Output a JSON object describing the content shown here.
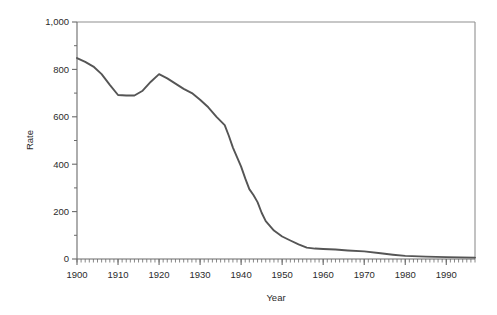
{
  "chart_data": {
    "type": "line",
    "title": "",
    "xlabel": "Year",
    "ylabel": "Rate",
    "xlim": [
      1900,
      1997
    ],
    "ylim": [
      0,
      1000
    ],
    "grid": false,
    "legend": null,
    "x_tick_labels": [
      "1900",
      "1910",
      "1920",
      "1930",
      "1940",
      "1950",
      "1960",
      "1970",
      "1980",
      "1990"
    ],
    "x_major_ticks": [
      1900,
      1910,
      1920,
      1930,
      1940,
      1950,
      1960,
      1970,
      1980,
      1990
    ],
    "x_minor_tick_interval": 1,
    "y_tick_labels": [
      "0",
      "200",
      "400",
      "600",
      "800",
      "1,000"
    ],
    "y_major_ticks": [
      0,
      200,
      400,
      600,
      800,
      1000
    ],
    "y_minor_ticks": [
      100,
      300,
      500,
      700,
      900
    ],
    "line_color": "#555555",
    "axis_color": "#808080",
    "series": [
      {
        "name": "Rate",
        "x": [
          1900,
          1902,
          1904,
          1906,
          1908,
          1910,
          1912,
          1914,
          1916,
          1918,
          1920,
          1922,
          1924,
          1926,
          1928,
          1930,
          1932,
          1934,
          1936,
          1937,
          1938,
          1939,
          1940,
          1941,
          1942,
          1943,
          1944,
          1945,
          1946,
          1947,
          1948,
          1950,
          1952,
          1954,
          1956,
          1958,
          1960,
          1963,
          1966,
          1970,
          1974,
          1977,
          1980,
          1985,
          1990,
          1997
        ],
        "y": [
          848,
          832,
          812,
          780,
          735,
          692,
          690,
          690,
          710,
          748,
          780,
          762,
          740,
          718,
          700,
          672,
          640,
          600,
          565,
          520,
          470,
          430,
          390,
          340,
          295,
          270,
          240,
          195,
          160,
          140,
          120,
          95,
          78,
          62,
          48,
          44,
          42,
          40,
          36,
          32,
          24,
          18,
          13,
          10,
          8,
          6
        ]
      }
    ]
  },
  "axis": {
    "x_title": "Year",
    "y_title": "Rate"
  }
}
